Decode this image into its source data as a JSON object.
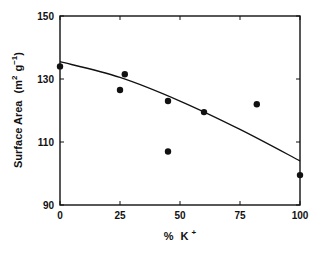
{
  "chart_data": {
    "type": "scatter",
    "title": "",
    "xlabel": "% K+",
    "xlabel_main": "%",
    "xlabel_unit": "K",
    "xlabel_sup": "+",
    "ylabel": "Surface Area (m2 g-1)",
    "ylabel_main": "Surface Area",
    "xlim": [
      0,
      100
    ],
    "ylim": [
      90,
      150
    ],
    "x_ticks": [
      0,
      25,
      50,
      75,
      100
    ],
    "y_ticks": [
      90,
      110,
      130,
      150
    ],
    "grid": false,
    "legend": null,
    "series": [
      {
        "name": "measured",
        "kind": "scatter",
        "points": [
          {
            "x": 0,
            "y": 134
          },
          {
            "x": 25,
            "y": 126.5
          },
          {
            "x": 27,
            "y": 131.5
          },
          {
            "x": 45,
            "y": 123
          },
          {
            "x": 45,
            "y": 107
          },
          {
            "x": 60,
            "y": 119.5
          },
          {
            "x": 82,
            "y": 122
          },
          {
            "x": 100,
            "y": 99.5
          }
        ]
      },
      {
        "name": "fit",
        "kind": "line",
        "points": [
          {
            "x": 0,
            "y": 135.5
          },
          {
            "x": 25,
            "y": 130.5
          },
          {
            "x": 50,
            "y": 123
          },
          {
            "x": 75,
            "y": 114
          },
          {
            "x": 100,
            "y": 104
          }
        ]
      }
    ]
  },
  "colors": {
    "ink": "#111111",
    "background": "#ffffff"
  }
}
